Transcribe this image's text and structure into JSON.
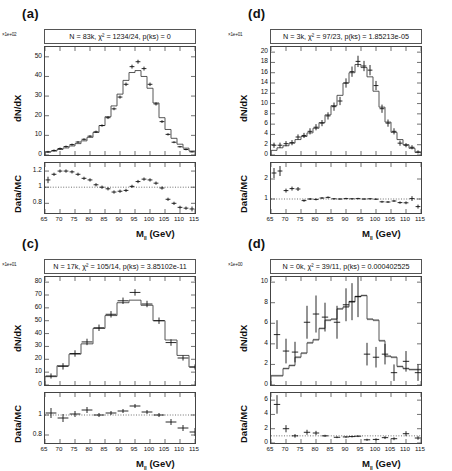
{
  "figure": {
    "axis_x_label": "M",
    "axis_x_label_sub": "ll",
    "axis_x_label_unit": "(GeV)",
    "axis_y_label": "dN/dX",
    "ratio_y_label": "Data/MC",
    "line_color": "#444444",
    "marker_color": "#111111",
    "band_color": "#b9b9b9"
  },
  "panels": [
    {
      "letter": "(a)",
      "multiplier": "×1e+02",
      "title": "N = 83k, χ² = 1234/24, p(ks) = 0",
      "n_label": "83k",
      "chi2": "1234/24",
      "pks": "0",
      "main_yticks": [
        0,
        10,
        20,
        30,
        40,
        50
      ],
      "main_ylim": [
        0,
        55
      ],
      "ratio_yticks": [
        0.8,
        1,
        1.2
      ],
      "ratio_ylim": [
        0.68,
        1.3
      ],
      "xlim": [
        65,
        115
      ],
      "xticks": [
        65,
        70,
        75,
        80,
        85,
        90,
        95,
        100,
        105,
        110,
        115
      ],
      "bin_width": 2,
      "mc": [
        1.5,
        2.0,
        2.8,
        3.6,
        4.6,
        5.8,
        7.2,
        9.0,
        11.5,
        15.0,
        19.5,
        25.0,
        31.0,
        38.0,
        42.0,
        43.0,
        40.0,
        34.0,
        26.5,
        19.0,
        13.0,
        8.5,
        5.5,
        3.5,
        2.0
      ],
      "data": [
        1.6,
        2.3,
        3.3,
        4.3,
        5.3,
        6.6,
        8.0,
        9.6,
        11.8,
        15.0,
        19.0,
        23.5,
        29.5,
        36.0,
        45.0,
        47.5,
        44.0,
        36.0,
        26.0,
        17.0,
        10.5,
        6.5,
        4.2,
        2.8,
        1.6
      ],
      "data_err": [
        0.5,
        0.5,
        0.5,
        0.5,
        0.5,
        0.5,
        0.5,
        0.5,
        0.6,
        0.6,
        0.7,
        0.7,
        0.8,
        0.9,
        1.0,
        1.0,
        1.0,
        0.9,
        0.8,
        0.7,
        0.6,
        0.5,
        0.4,
        0.4,
        0.3
      ],
      "ratio": [
        1.09,
        1.16,
        1.2,
        1.2,
        1.19,
        1.16,
        1.11,
        1.09,
        1.03,
        1.0,
        0.98,
        0.94,
        0.95,
        0.96,
        1.01,
        1.07,
        1.1,
        1.09,
        1.05,
        0.99,
        0.85,
        0.8,
        0.75,
        0.74,
        0.73
      ],
      "ratio_err": [
        0.04,
        0.02,
        0.02,
        0.02,
        0.02,
        0.02,
        0.02,
        0.02,
        0.02,
        0.02,
        0.02,
        0.02,
        0.02,
        0.02,
        0.02,
        0.02,
        0.02,
        0.02,
        0.02,
        0.02,
        0.02,
        0.02,
        0.02,
        0.02,
        0.03
      ],
      "band": false
    },
    {
      "letter": "(d)",
      "multiplier": "×1e+01",
      "title": "N = 3k, χ² = 97/23, p(ks) = 1.85213e-05",
      "n_label": "3k",
      "chi2": "97/23",
      "pks": "1.85213e-05",
      "main_yticks": [
        0,
        2,
        4,
        6,
        8,
        10,
        12,
        14,
        16,
        18,
        20
      ],
      "main_ylim": [
        0,
        21
      ],
      "ratio_yticks": [
        1,
        2
      ],
      "ratio_ylim": [
        0.3,
        2.8
      ],
      "xlim": [
        65,
        115
      ],
      "xticks": [
        65,
        70,
        75,
        80,
        85,
        90,
        95,
        100,
        105,
        110,
        115
      ],
      "bin_width": 2,
      "mc": [
        0.9,
        1.4,
        1.8,
        2.3,
        3.0,
        3.6,
        4.3,
        5.2,
        6.3,
        7.8,
        9.6,
        11.6,
        14.0,
        16.0,
        17.6,
        17.0,
        15.2,
        12.4,
        9.3,
        6.4,
        4.4,
        3.0,
        2.0,
        1.3,
        0.5
      ],
      "data": [
        1.9,
        1.9,
        2.2,
        2.4,
        3.5,
        3.8,
        4.6,
        5.4,
        6.2,
        7.6,
        9.4,
        10.5,
        14.0,
        16.2,
        18.2,
        17.3,
        16.5,
        13.5,
        9.0,
        6.2,
        4.6,
        2.3,
        1.9,
        1.5,
        0.6
      ],
      "data_err": [
        0.5,
        0.5,
        0.5,
        0.5,
        0.5,
        0.5,
        0.6,
        0.6,
        0.6,
        0.7,
        0.8,
        0.8,
        0.9,
        1.0,
        1.1,
        1.0,
        1.0,
        0.9,
        0.8,
        0.7,
        0.6,
        0.5,
        0.4,
        0.4,
        0.3
      ],
      "ratio": [
        2.3,
        2.4,
        1.42,
        1.52,
        1.5,
        0.92,
        1.0,
        0.98,
        1.05,
        1.08,
        1.01,
        1.0,
        1.02,
        1.01,
        1.02,
        1.0,
        1.01,
        0.99,
        0.86,
        0.85,
        0.9,
        0.82,
        0.81,
        1.02,
        0.62
      ],
      "ratio_err": [
        0.25,
        0.25,
        0.1,
        0.1,
        0.1,
        0.06,
        0.05,
        0.05,
        0.05,
        0.05,
        0.04,
        0.04,
        0.04,
        0.04,
        0.04,
        0.04,
        0.04,
        0.04,
        0.05,
        0.05,
        0.05,
        0.06,
        0.07,
        0.12,
        0.1
      ],
      "band": false
    },
    {
      "letter": "(c)",
      "multiplier": "×1e+01",
      "title": "N = 17k, χ² = 105/14, p(ks) = 3.85102e-11",
      "n_label": "17k",
      "chi2": "105/14",
      "pks": "3.85102e-11",
      "main_yticks": [
        0,
        10,
        20,
        30,
        40,
        50,
        60,
        70,
        80
      ],
      "main_ylim": [
        0,
        84
      ],
      "ratio_yticks": [
        0.8,
        1
      ],
      "ratio_ylim": [
        0.72,
        1.22
      ],
      "xlim": [
        65,
        115
      ],
      "xticks": [
        65,
        70,
        75,
        80,
        85,
        90,
        95,
        100,
        105,
        110,
        115
      ],
      "bin_width": 4,
      "mc": [
        6.5,
        15.0,
        24.0,
        32.0,
        44.0,
        54.0,
        64.0,
        66.0,
        62.0,
        50.0,
        35.0,
        23.0,
        14.0,
        9.0
      ],
      "data": [
        7.0,
        14.5,
        24.5,
        33.5,
        44.5,
        55.0,
        65.5,
        72.0,
        63.0,
        50.0,
        33.0,
        21.0,
        14.0,
        9.5
      ],
      "data_err": [
        2.0,
        2.5,
        2.5,
        2.5,
        2.5,
        2.5,
        2.5,
        2.5,
        2.5,
        2.5,
        2.5,
        2.0,
        2.0,
        2.0
      ],
      "ratio": [
        1.02,
        0.97,
        1.01,
        1.05,
        1.0,
        1.02,
        1.04,
        1.09,
        1.03,
        1.0,
        0.93,
        0.87,
        0.83,
        0.78
      ],
      "ratio_err": [
        0.05,
        0.04,
        0.03,
        0.03,
        0.02,
        0.02,
        0.02,
        0.02,
        0.02,
        0.02,
        0.03,
        0.03,
        0.04,
        0.04
      ],
      "band": false
    },
    {
      "letter": "(d)",
      "multiplier": "×1e+00",
      "title": "N = 0k, χ² = 39/11, p(ks) = 0.000402525",
      "n_label": "0k",
      "chi2": "39/11",
      "pks": "0.000402525",
      "main_yticks": [
        0,
        2,
        4,
        6,
        8,
        10
      ],
      "main_ylim": [
        0,
        10.5
      ],
      "ratio_yticks": [
        0,
        2,
        4,
        6
      ],
      "ratio_ylim": [
        0,
        7
      ],
      "xlim": [
        65,
        115
      ],
      "xticks": [
        65,
        70,
        75,
        80,
        85,
        90,
        95,
        100,
        105,
        110,
        115
      ],
      "bin_width": 2,
      "mc": [
        0.9,
        0.9,
        1.6,
        1.9,
        2.7,
        3.1,
        4.1,
        4.4,
        5.5,
        6.3,
        6.4,
        7.4,
        7.6,
        8.1,
        8.6,
        8.7,
        6.4,
        6.3,
        4.3,
        2.8,
        2.7,
        1.8,
        1.6,
        1.5,
        1.5
      ],
      "data": [
        4.9,
        3.3,
        3.2,
        6.1,
        6.9,
        6.6,
        6.1,
        7.8,
        8.1,
        8.6,
        3.0,
        2.7,
        3.0,
        1.2,
        2.3,
        1.2
      ],
      "data_x": [
        67,
        70,
        73,
        77,
        80,
        83,
        87,
        90,
        92,
        94,
        97,
        100,
        103,
        106,
        110,
        114
      ],
      "data_err": [
        1.4,
        1.2,
        1.0,
        1.6,
        1.8,
        1.4,
        1.6,
        1.6,
        1.8,
        2.0,
        1.1,
        1.0,
        1.0,
        0.8,
        1.0,
        0.8
      ],
      "ratio": [
        5.4,
        2.0,
        1.0,
        1.5,
        1.4,
        1.0,
        0.8,
        0.85,
        0.9,
        0.95,
        0.45,
        0.5,
        0.75,
        0.6,
        1.3,
        0.7
      ],
      "ratio_x": [
        67,
        70,
        73,
        77,
        80,
        83,
        87,
        90,
        92,
        94,
        97,
        100,
        103,
        106,
        110,
        114
      ],
      "ratio_err": [
        1.3,
        0.5,
        0.25,
        0.35,
        0.3,
        0.15,
        0.12,
        0.12,
        0.12,
        0.12,
        0.15,
        0.15,
        0.2,
        0.2,
        0.35,
        0.25
      ],
      "band": true
    }
  ]
}
